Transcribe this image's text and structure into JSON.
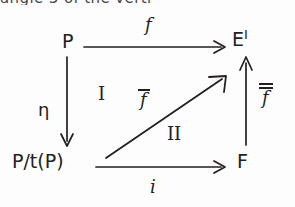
{
  "page": {
    "width": 295,
    "height": 207,
    "background_color": "#fdfdfd",
    "ink_color": "#231f20",
    "cut_off_top_line": "angle 3 of the verti"
  },
  "diagram": {
    "kind": "commutative-diagram",
    "nodes": [
      {
        "id": "P",
        "label": "P",
        "superscript": "",
        "x": 62,
        "y": 32
      },
      {
        "id": "EI",
        "label": "E",
        "superscript": "I",
        "x": 232,
        "y": 30
      },
      {
        "id": "PtP",
        "label": "P/t(P)",
        "superscript": "",
        "x": 12,
        "y": 152
      },
      {
        "id": "F",
        "label": "F",
        "superscript": "",
        "x": 237,
        "y": 152
      }
    ],
    "arrows": [
      {
        "id": "top",
        "from": "P",
        "to": "EI",
        "label": "f",
        "label_overlines": 0,
        "label_position": "above",
        "direction": "right",
        "x1": 84,
        "y1": 47,
        "x2": 225,
        "y2": 47
      },
      {
        "id": "left",
        "from": "P",
        "to": "PtP",
        "label": "η",
        "label_overlines": 0,
        "label_position": "left",
        "direction": "down",
        "x1": 67,
        "y1": 57,
        "x2": 67,
        "y2": 146
      },
      {
        "id": "bottom",
        "from": "PtP",
        "to": "F",
        "label": "i",
        "label_overlines": 0,
        "label_position": "below",
        "direction": "right",
        "x1": 96,
        "y1": 167,
        "x2": 225,
        "y2": 167
      },
      {
        "id": "right",
        "from": "F",
        "to": "EI",
        "label": "f",
        "label_overlines": 2,
        "label_position": "right",
        "direction": "up",
        "x1": 246,
        "y1": 145,
        "x2": 246,
        "y2": 57
      },
      {
        "id": "diagonal",
        "from": "PtP",
        "to": "EI",
        "label": "f",
        "label_overlines": 1,
        "label_position": "above-left",
        "direction": "up-right",
        "x1": 106,
        "y1": 158,
        "x2": 226,
        "y2": 76
      }
    ],
    "labels": {
      "top_arrow": "f",
      "left_arrow": "η",
      "bottom_arrow": "i",
      "right_arrow": "f",
      "diagonal_arrow": "f"
    },
    "regions": [
      {
        "id": "I",
        "numeral": "I",
        "x": 98,
        "y": 85
      },
      {
        "id": "II",
        "numeral": "II",
        "x": 167,
        "y": 125
      }
    ]
  }
}
